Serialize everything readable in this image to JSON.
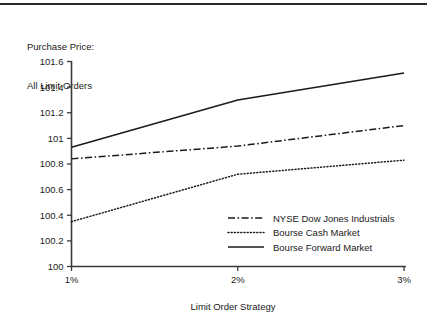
{
  "figure": {
    "title_line1": "Purchase Price:",
    "title_line2": "All Limit Orders",
    "top_rule": true,
    "background": "#ffffff",
    "ink_color": "#1a1a1a"
  },
  "chart_data": {
    "type": "line",
    "title": "Purchase Price: All Limit Orders",
    "subtitle": "",
    "xlabel": "Limit Order Strategy",
    "ylabel": "",
    "categories": [
      "1%",
      "2%",
      "3%"
    ],
    "x": [
      1,
      2,
      3
    ],
    "xlim": [
      1,
      3
    ],
    "ylim": [
      100,
      101.6
    ],
    "grid": false,
    "legend_position": "inside lower-right",
    "ytick_labels": [
      "100",
      "100.2",
      "100.4",
      "100.6",
      "100.8",
      "101",
      "101.2",
      "101.4",
      "101.6"
    ],
    "ytick_values": [
      100,
      100.2,
      100.4,
      100.6,
      100.8,
      101,
      101.2,
      101.4,
      101.6
    ],
    "xtick_labels": [
      "1%",
      "2%",
      "3%"
    ],
    "series": [
      {
        "name": "NYSE Dow Jones Industrials",
        "style": "dash-dot",
        "color": "#1a1a1a",
        "values": [
          100.84,
          100.94,
          101.1
        ]
      },
      {
        "name": "Bourse Cash Market",
        "style": "dotted",
        "color": "#1a1a1a",
        "values": [
          100.35,
          100.72,
          100.83
        ]
      },
      {
        "name": "Bourse Forward Market",
        "style": "solid",
        "color": "#1a1a1a",
        "values": [
          100.93,
          101.3,
          101.51
        ]
      }
    ]
  }
}
